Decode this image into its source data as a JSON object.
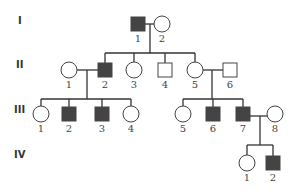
{
  "diagram": {
    "type": "pedigree",
    "colors": {
      "affected": "#444444",
      "unaffected": "#ffffff",
      "line": "#333333"
    },
    "generations": [
      {
        "label": "I",
        "y": 20
      },
      {
        "label": "II",
        "y": 64
      },
      {
        "label": "III",
        "y": 109
      },
      {
        "label": "IV",
        "y": 154
      }
    ],
    "individuals": [
      {
        "id": "I-1",
        "label": "1",
        "sex": "male",
        "affected": true,
        "cx": 138,
        "cy": 24
      },
      {
        "id": "I-2",
        "label": "2",
        "sex": "female",
        "affected": false,
        "cx": 162,
        "cy": 24
      },
      {
        "id": "II-1",
        "label": "1",
        "sex": "female",
        "affected": false,
        "cx": 69,
        "cy": 70
      },
      {
        "id": "II-2",
        "label": "2",
        "sex": "male",
        "affected": true,
        "cx": 105,
        "cy": 70
      },
      {
        "id": "II-3",
        "label": "3",
        "sex": "female",
        "affected": false,
        "cx": 134,
        "cy": 70
      },
      {
        "id": "II-4",
        "label": "4",
        "sex": "male",
        "affected": false,
        "cx": 165,
        "cy": 70
      },
      {
        "id": "II-5",
        "label": "5",
        "sex": "female",
        "affected": false,
        "cx": 195,
        "cy": 70
      },
      {
        "id": "II-6",
        "label": "6",
        "sex": "male",
        "affected": false,
        "cx": 230,
        "cy": 70
      },
      {
        "id": "III-1",
        "label": "1",
        "sex": "female",
        "affected": false,
        "cx": 41,
        "cy": 114
      },
      {
        "id": "III-2",
        "label": "2",
        "sex": "male",
        "affected": true,
        "cx": 69,
        "cy": 114
      },
      {
        "id": "III-3",
        "label": "3",
        "sex": "male",
        "affected": true,
        "cx": 102,
        "cy": 114
      },
      {
        "id": "III-4",
        "label": "4",
        "sex": "female",
        "affected": false,
        "cx": 131,
        "cy": 114
      },
      {
        "id": "III-5",
        "label": "5",
        "sex": "female",
        "affected": false,
        "cx": 183,
        "cy": 114
      },
      {
        "id": "III-6",
        "label": "6",
        "sex": "male",
        "affected": true,
        "cx": 213,
        "cy": 114
      },
      {
        "id": "III-7",
        "label": "7",
        "sex": "male",
        "affected": true,
        "cx": 243,
        "cy": 114
      },
      {
        "id": "III-8",
        "label": "8",
        "sex": "female",
        "affected": false,
        "cx": 275,
        "cy": 114
      },
      {
        "id": "IV-1",
        "label": "1",
        "sex": "female",
        "affected": false,
        "cx": 247,
        "cy": 163
      },
      {
        "id": "IV-2",
        "label": "2",
        "sex": "male",
        "affected": true,
        "cx": 273,
        "cy": 163
      }
    ],
    "matings": [
      {
        "partners": [
          "I-1",
          "I-2"
        ],
        "children": [
          "II-2",
          "II-3",
          "II-4",
          "II-5"
        ]
      },
      {
        "partners": [
          "II-1",
          "II-2"
        ],
        "children": [
          "III-1",
          "III-2",
          "III-3",
          "III-4"
        ]
      },
      {
        "partners": [
          "II-5",
          "II-6"
        ],
        "children": [
          "III-5",
          "III-6",
          "III-7"
        ]
      },
      {
        "partners": [
          "III-7",
          "III-8"
        ],
        "children": [
          "IV-1",
          "IV-2"
        ]
      }
    ]
  }
}
